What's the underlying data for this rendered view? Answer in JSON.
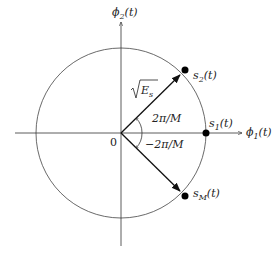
{
  "diagram": {
    "type": "M-ary PSK signal constellation",
    "axes": {
      "horizontal": {
        "label": "ϕ",
        "subscript": "1",
        "arg": "(t)"
      },
      "vertical": {
        "label": "ϕ",
        "subscript": "2",
        "arg": "(t)"
      }
    },
    "origin_label": "0",
    "radius_label": {
      "root": "√",
      "symbol": "E",
      "subscript": "s"
    },
    "angles": [
      {
        "label": "2π/M",
        "direction": "counterclockwise"
      },
      {
        "label": "−2π/M",
        "direction": "clockwise"
      }
    ],
    "points": [
      {
        "name": "s",
        "subscript": "1",
        "arg": "(t)",
        "angle_deg": 0
      },
      {
        "name": "s",
        "subscript": "2",
        "arg": "(t)",
        "angle_deg": 45
      },
      {
        "name": "s",
        "subscript": "M",
        "arg": "(t)",
        "angle_deg": -45
      }
    ],
    "colors": {
      "line": "#333333",
      "point": "#000000",
      "background": "#ffffff"
    }
  }
}
